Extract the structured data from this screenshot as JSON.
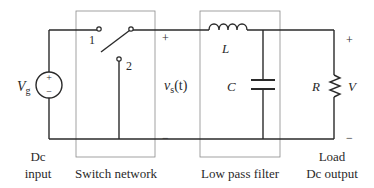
{
  "diagram": {
    "type": "buck converter block diagram",
    "source": {
      "label": "V",
      "subscript": "g",
      "plus": "+",
      "minus": "−"
    },
    "switch": {
      "terminal1": "1",
      "terminal2": "2"
    },
    "switch_output": {
      "label_v": "v",
      "label_sub": "s",
      "label_rest": "(t)",
      "plus": "+",
      "minus": "−"
    },
    "inductor": {
      "label": "L"
    },
    "capacitor": {
      "label": "C"
    },
    "resistor": {
      "label": "R"
    },
    "output": {
      "label": "V",
      "plus": "+",
      "minus": "−"
    },
    "captions": {
      "dc_input_line1": "Dc",
      "dc_input_line2": "input",
      "switch_network": "Switch network",
      "low_pass_filter": "Low pass filter",
      "load_line1": "Load",
      "load_line2": "Dc output"
    },
    "colors": {
      "wire": "#2a2a2a",
      "box": "#8a8a8a",
      "background": "#ffffff"
    }
  }
}
